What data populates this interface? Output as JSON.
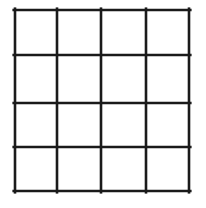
{
  "figure": {
    "title": "",
    "kind": "grid-drawing",
    "background_color": "#ffffff",
    "line_color": "#1a1a1a",
    "line_width_px": 2.6,
    "canvas": {
      "width": 206,
      "height": 208
    },
    "rows": 4,
    "columns": 4,
    "cell_count": 16,
    "vertical_line_x": [
      15,
      57,
      101,
      146,
      189
    ],
    "horizontal_line_y": [
      10,
      55,
      103,
      147,
      191
    ],
    "cells": [
      {
        "row": 1,
        "column": 1,
        "label": ""
      },
      {
        "row": 1,
        "column": 2,
        "label": ""
      },
      {
        "row": 1,
        "column": 3,
        "label": ""
      },
      {
        "row": 1,
        "column": 4,
        "label": ""
      },
      {
        "row": 2,
        "column": 1,
        "label": ""
      },
      {
        "row": 2,
        "column": 2,
        "label": ""
      },
      {
        "row": 2,
        "column": 3,
        "label": ""
      },
      {
        "row": 2,
        "column": 4,
        "label": ""
      },
      {
        "row": 3,
        "column": 1,
        "label": ""
      },
      {
        "row": 3,
        "column": 2,
        "label": ""
      },
      {
        "row": 3,
        "column": 3,
        "label": ""
      },
      {
        "row": 3,
        "column": 4,
        "label": ""
      },
      {
        "row": 4,
        "column": 1,
        "label": ""
      },
      {
        "row": 4,
        "column": 2,
        "label": ""
      },
      {
        "row": 4,
        "column": 3,
        "label": ""
      },
      {
        "row": 4,
        "column": 4,
        "label": ""
      }
    ]
  }
}
